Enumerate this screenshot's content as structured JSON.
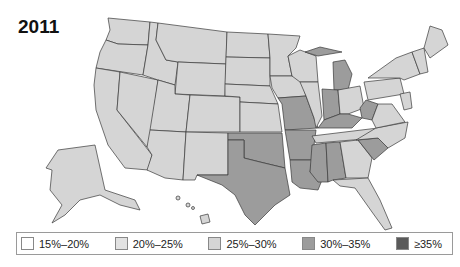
{
  "title": "2011",
  "legend": [
    {
      "label": "15%–20%",
      "color": "#ffffff"
    },
    {
      "label": "20%–25%",
      "color": "#e2e2e2"
    },
    {
      "label": "25%–30%",
      "color": "#d5d5d5"
    },
    {
      "label": "30%–35%",
      "color": "#9c9c9c"
    },
    {
      "label": "≥35%",
      "color": "#5a5a5a"
    }
  ],
  "map": {
    "category_30_35": [
      "Texas",
      "Oklahoma",
      "Arkansas",
      "Louisiana",
      "Mississippi",
      "Alabama",
      "Missouri",
      "Kentucky",
      "Indiana",
      "Michigan",
      "West Virginia",
      "South Carolina"
    ],
    "category_25_30": [
      "Washington",
      "Oregon",
      "California",
      "Nevada",
      "Idaho",
      "Montana",
      "Wyoming",
      "Utah",
      "Arizona",
      "New Mexico",
      "Colorado",
      "North Dakota",
      "South Dakota",
      "Nebraska",
      "Kansas",
      "Minnesota",
      "Iowa",
      "Wisconsin",
      "Illinois",
      "Ohio",
      "Tennessee",
      "Georgia",
      "Florida",
      "North Carolina",
      "Virginia",
      "Pennsylvania",
      "New York",
      "Maine",
      "Alaska",
      "Hawaii"
    ]
  }
}
